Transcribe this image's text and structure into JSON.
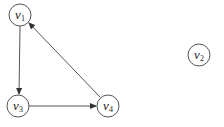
{
  "diagram": {
    "type": "directed-graph",
    "nodes": [
      {
        "id": "v1",
        "base": "v",
        "sub": "1",
        "x": 20,
        "y": 15
      },
      {
        "id": "v2",
        "base": "v",
        "sub": "2",
        "x": 199,
        "y": 55
      },
      {
        "id": "v3",
        "base": "v",
        "sub": "3",
        "x": 18,
        "y": 106
      },
      {
        "id": "v4",
        "base": "v",
        "sub": "4",
        "x": 108,
        "y": 106
      }
    ],
    "edges": [
      {
        "from": "v1",
        "to": "v3"
      },
      {
        "from": "v3",
        "to": "v4"
      },
      {
        "from": "v4",
        "to": "v1"
      }
    ],
    "colors": {
      "stroke": "#555555",
      "text": "#222222",
      "background": "#ffffff"
    }
  }
}
